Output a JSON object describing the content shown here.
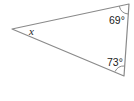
{
  "diagram": {
    "type": "triangle",
    "stroke_color": "#8a8a8a",
    "vertices": {
      "left": [
        12,
        29
      ],
      "top_right": [
        129,
        4
      ],
      "bottom_right": [
        124,
        76
      ]
    },
    "angles": {
      "left": {
        "label": "x",
        "unknown": true
      },
      "top_right": {
        "label": "69°",
        "value": 69
      },
      "bottom_right": {
        "label": "73°",
        "value": 73
      }
    }
  }
}
